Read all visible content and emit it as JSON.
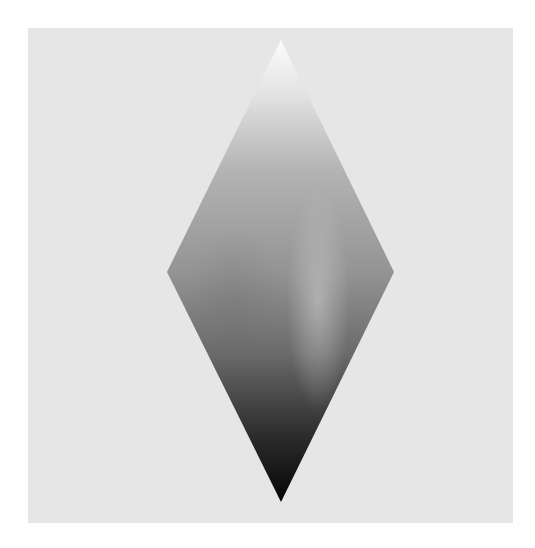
{
  "figure": {
    "background_color": "#ffffff",
    "panel": {
      "color": "#e6e6e6",
      "x": 28,
      "y": 28,
      "width": 485,
      "height": 495
    },
    "rhombus": {
      "vertices": {
        "top": [
          281,
          40
        ],
        "right": [
          394,
          272
        ],
        "bottom": [
          281,
          502
        ],
        "left": [
          167,
          272
        ]
      },
      "gradient": {
        "direction": "vertical",
        "stops": [
          {
            "offset": "0%",
            "color": "#fcfcfc"
          },
          {
            "offset": "12%",
            "color": "#e2e2e2"
          },
          {
            "offset": "28%",
            "color": "#b4b4b4"
          },
          {
            "offset": "50%",
            "color": "#949494"
          },
          {
            "offset": "68%",
            "color": "#6a6a6a"
          },
          {
            "offset": "85%",
            "color": "#2e2e2e"
          },
          {
            "offset": "100%",
            "color": "#050505"
          }
        ]
      },
      "highlight": {
        "color": "#c8c8c8",
        "center_x": 315,
        "center_y": 300
      }
    }
  }
}
